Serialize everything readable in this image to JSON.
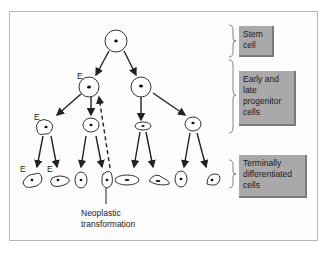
{
  "labels": {
    "stem": "Stem cell",
    "stem_l1": "Stem",
    "stem_l2": "cell",
    "progenitor_l1": "Early and",
    "progenitor_l2": "late",
    "progenitor_l3": "progenitor",
    "progenitor_l4": "cells",
    "terminal_l1": "Terminally",
    "terminal_l2": "differentiated",
    "terminal_l3": "cells",
    "neoplastic_l1": "Neoplastic",
    "neoplastic_l2": "transformation",
    "e_marker": "E"
  },
  "colors": {
    "box_fill": "#a9a9a9",
    "box_shadow": "#7a7a7a",
    "line": "#222222",
    "frame": "#b8b8b8"
  }
}
